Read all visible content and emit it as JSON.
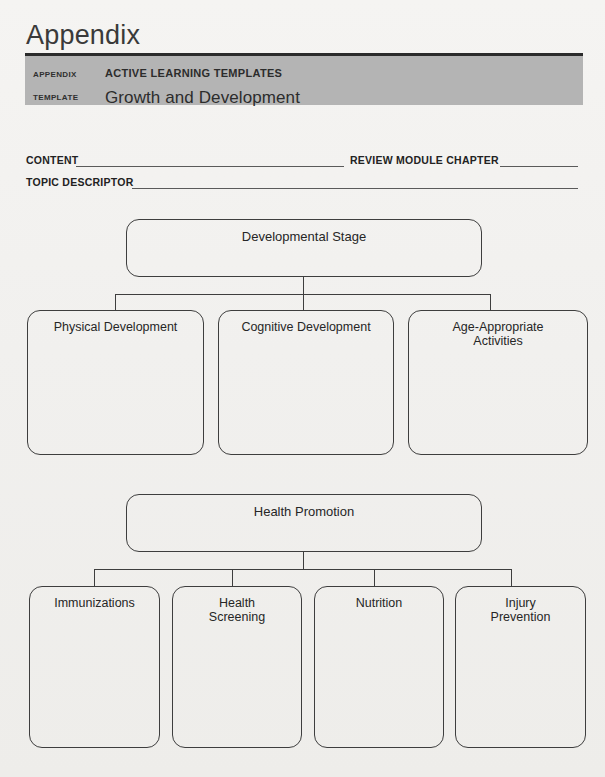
{
  "header": {
    "appendix_title": "Appendix",
    "rows": [
      {
        "key": "APPENDIX",
        "value": "ACTIVE LEARNING TEMPLATES"
      },
      {
        "key": "TEMPLATE",
        "value": "Growth and Development"
      }
    ]
  },
  "fields": {
    "content_label": "CONTENT",
    "review_module_chapter_label": "REVIEW MODULE CHAPTER",
    "topic_descriptor_label": "TOPIC DESCRIPTOR",
    "content_value": "",
    "review_module_chapter_value": "",
    "topic_descriptor_value": ""
  },
  "diagram": {
    "sections": [
      {
        "parent": "Developmental Stage",
        "children": [
          "Physical Development",
          "Cognitive Development",
          "Age-Appropriate\nActivities"
        ]
      },
      {
        "parent": "Health Promotion",
        "children": [
          "Immunizations",
          "Health\nScreening",
          "Nutrition",
          "Injury\nPrevention"
        ]
      }
    ]
  },
  "colors": {
    "page_background": "#f2f1ef",
    "bar_gray": "#b4b4b4",
    "rule_dark": "#2b2b2b",
    "line_stroke": "#3e3e3e",
    "text": "#262626"
  }
}
